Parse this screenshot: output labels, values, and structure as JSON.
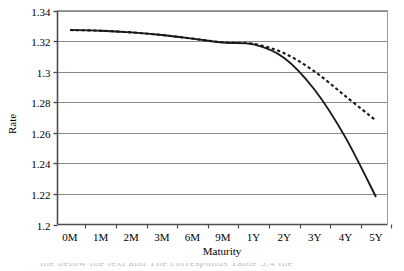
{
  "chart_data": {
    "type": "line",
    "title": "",
    "xlabel": "Maturity",
    "ylabel": "Rate",
    "categories": [
      "0M",
      "1M",
      "2M",
      "3M",
      "6M",
      "9M",
      "1Y",
      "2Y",
      "3Y",
      "4Y",
      "5Y"
    ],
    "ylim": [
      1.2,
      1.34
    ],
    "yticks": [
      "1.2",
      "1.22",
      "1.24",
      "1.26",
      "1.28",
      "1.3",
      "1.32",
      "1.34"
    ],
    "ytick_values": [
      1.2,
      1.22,
      1.24,
      1.26,
      1.28,
      1.3,
      1.32,
      1.34
    ],
    "grid": "horizontal",
    "legend": "none",
    "series": [
      {
        "name": "solid-curve",
        "style": "solid",
        "color": "#1a1a1a",
        "values": [
          1.3272,
          1.3268,
          1.3257,
          1.324,
          1.3216,
          1.319,
          1.3178,
          1.309,
          1.288,
          1.257,
          1.218
        ]
      },
      {
        "name": "dashed-curve",
        "style": "dashed",
        "color": "#1a1a1a",
        "values": [
          1.3272,
          1.3268,
          1.3257,
          1.324,
          1.3216,
          1.3192,
          1.3182,
          1.312,
          1.3,
          1.284,
          1.268
        ]
      }
    ]
  },
  "axes": {
    "y_axis_title": "Rate",
    "x_axis_title": "Maturity"
  },
  "footer": {
    "cut_off_text": "the below the text and The corresponds Table 3.4 the"
  },
  "colors": {
    "axis": "#4d4d4d",
    "grid": "#808080",
    "line": "#1a1a1a",
    "background": "#ffffff"
  }
}
